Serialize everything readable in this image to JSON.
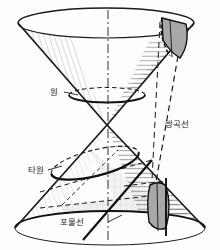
{
  "figure": {
    "background_color": "#fdfdfd",
    "stroke_color": "#1a1a1a",
    "shade_color": "#a0a0a0",
    "light_shade_color": "#e2e2e2",
    "hatch_color": "#555555"
  },
  "labels": {
    "circle": "원",
    "hyperbola": "쌍곡선",
    "ellipse": "타원",
    "parabola": "포물선"
  },
  "geometry": {
    "apex": {
      "x": 107,
      "y": 125
    },
    "top_rim": {
      "cx": 106,
      "cy": 23,
      "rx": 88,
      "ry": 15
    },
    "bottom_rim": {
      "cx": 110,
      "cy": 228,
      "rx": 95,
      "ry": 17
    },
    "circle_section": {
      "cx": 107,
      "cy": 95,
      "rx": 38,
      "ry": 7
    },
    "ellipse_section": {
      "cx": 95,
      "cy": 163,
      "rx": 45,
      "ry": 13,
      "rotation_deg": -14
    },
    "axis": {
      "x": 108,
      "y_top": 10,
      "y_bottom": 240,
      "style": "dash-dot"
    }
  },
  "sections": [
    {
      "name": "circle",
      "label": "원",
      "plane": "horizontal",
      "curve": "circle"
    },
    {
      "name": "ellipse",
      "label": "타원",
      "plane": "oblique",
      "curve": "ellipse"
    },
    {
      "name": "parabola",
      "label": "포물선",
      "plane": "parallel-to-generator",
      "curve": "parabola"
    },
    {
      "name": "hyperbola",
      "label": "쌍곡선",
      "plane": "vertical",
      "curve": "hyperbola"
    }
  ]
}
